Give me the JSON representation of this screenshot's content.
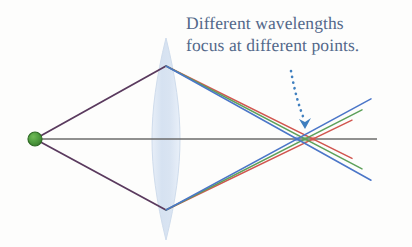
{
  "figure": {
    "title_text": "Different wavelengths focus at different points.",
    "caption_line_1": "Different wavelengths",
    "caption_line_2": "focus at different points.",
    "caption_color": "#53688a",
    "background_color": "#fdfdfc"
  },
  "chart_data": {
    "type": "diagram",
    "title": "Different wavelengths focus at different points.",
    "xlabel": "",
    "ylabel": "",
    "grid": false,
    "legend": "none",
    "axis": {
      "name": "optical-axis",
      "color": "#6b6b6b",
      "x_start": 35,
      "x_end": 377,
      "y": 139
    },
    "source": {
      "name": "point-source",
      "label": "",
      "color": "#4f9c3f",
      "edge_color": "#2f6b25",
      "x": 35,
      "y": 139,
      "radius": 7
    },
    "lens": {
      "name": "biconvex-lens",
      "center_x": 166,
      "center_y": 139,
      "half_height": 101,
      "half_width": 14,
      "fill": "#dde6f2",
      "edge": "#cbd8ea"
    },
    "incident_rays": [
      {
        "name": "upper-incident-ray",
        "color": "#5a3a5e",
        "x1": 35,
        "y1": 139,
        "x2": 166,
        "y2": 66
      },
      {
        "name": "lower-incident-ray",
        "color": "#5a3a5e",
        "x1": 35,
        "y1": 139,
        "x2": 166,
        "y2": 210
      }
    ],
    "wavelengths": [
      {
        "name": "blue",
        "label": "blue",
        "color": "#4b76c8",
        "focus_x": 297,
        "focus_y": 139,
        "note": "shortest wavelength, focuses nearest the lens",
        "upper_exit_y": 66,
        "lower_exit_y": 210,
        "end_x": 371
      },
      {
        "name": "green",
        "label": "green",
        "color": "#5da05a",
        "focus_x": 305,
        "focus_y": 139,
        "note": "middle wavelength, intermediate focus",
        "upper_exit_y": 66,
        "lower_exit_y": 210,
        "end_x": 362
      },
      {
        "name": "red",
        "label": "red",
        "color": "#d1564f",
        "focus_x": 313,
        "focus_y": 139,
        "note": "longest wavelength, focuses farthest from the lens",
        "upper_exit_y": 66,
        "lower_exit_y": 210,
        "end_x": 352
      }
    ],
    "annotation": {
      "name": "dotted-arrow",
      "color": "#3f7fbf",
      "style": "dotted-curve-with-arrowhead",
      "from_x": 292,
      "from_y": 72,
      "to_x": 305,
      "to_y": 124,
      "points_at": "focus-cluster"
    },
    "focus_cluster": {
      "name": "focus-point-cluster",
      "x_range": [
        295,
        315
      ],
      "y": 139,
      "description": "Blue, green and red rays cross the optical axis at three different points."
    }
  }
}
